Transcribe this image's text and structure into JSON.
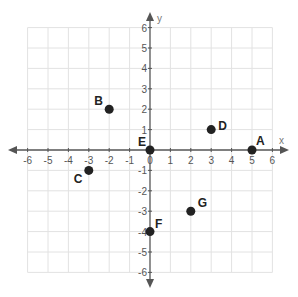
{
  "chart_data": {
    "type": "scatter",
    "title": "",
    "xlabel": "x",
    "ylabel": "y",
    "xlim": [
      -6,
      6
    ],
    "ylim": [
      -6,
      6
    ],
    "grid": true,
    "x_ticks": [
      -6,
      -5,
      -4,
      -3,
      -2,
      -1,
      0,
      1,
      2,
      3,
      4,
      5,
      6
    ],
    "y_ticks": [
      -6,
      -5,
      -4,
      -3,
      -2,
      -1,
      1,
      2,
      3,
      4,
      5,
      6
    ],
    "points": [
      {
        "label": "A",
        "x": 5,
        "y": 0,
        "label_dx": 4,
        "label_dy": -5
      },
      {
        "label": "B",
        "x": -2,
        "y": 2,
        "label_dx": -15,
        "label_dy": -4
      },
      {
        "label": "C",
        "x": -3,
        "y": -1,
        "label_dx": -15,
        "label_dy": 13
      },
      {
        "label": "D",
        "x": 3,
        "y": 1,
        "label_dx": 7,
        "label_dy": 0
      },
      {
        "label": "E",
        "x": 0,
        "y": 0,
        "label_dx": -12,
        "label_dy": -4
      },
      {
        "label": "F",
        "x": 0,
        "y": -4,
        "label_dx": 5,
        "label_dy": -4
      },
      {
        "label": "G",
        "x": 2,
        "y": -3,
        "label_dx": 7,
        "label_dy": -4
      }
    ]
  },
  "colors": {
    "grid": "#e2e2e2",
    "axis": "#555555",
    "point": "#222222"
  }
}
